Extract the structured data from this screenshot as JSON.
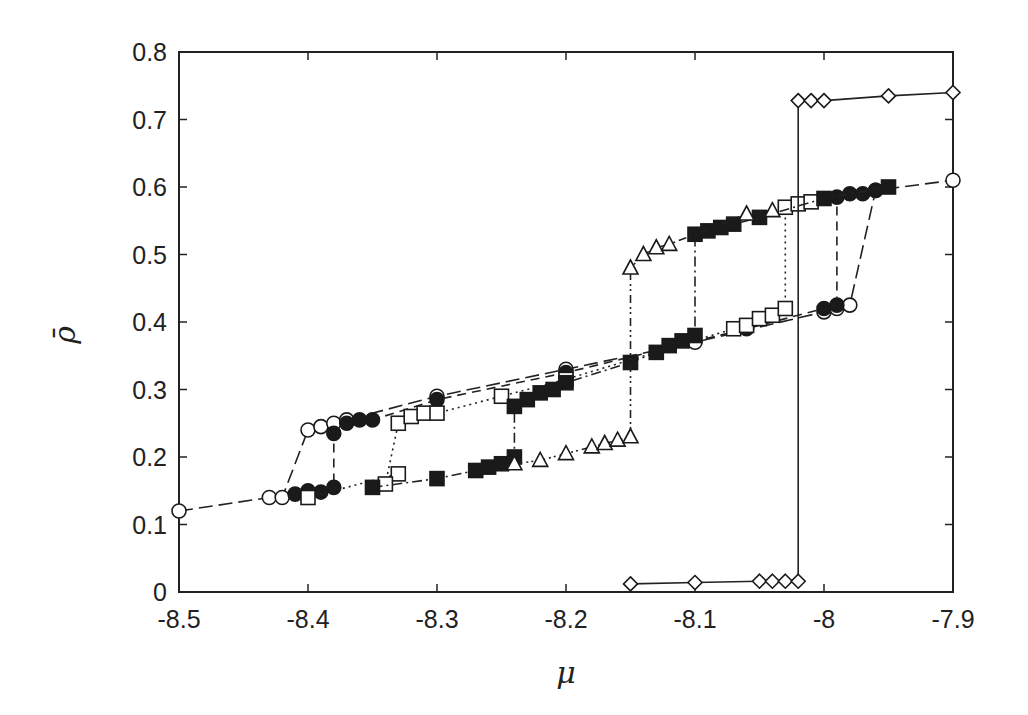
{
  "chart_data": {
    "type": "scatter",
    "title": "",
    "xlabel": "μ",
    "ylabel": "ρ̄",
    "xlim": [
      -8.5,
      -7.9
    ],
    "ylim": [
      0,
      0.8
    ],
    "grid": false,
    "legend": "none",
    "xticks": [
      "-8.5",
      "-8.4",
      "-8.3",
      "-8.2",
      "-8.1",
      "-8",
      "-7.9"
    ],
    "xtick_values": [
      -8.5,
      -8.4,
      -8.3,
      -8.2,
      -8.1,
      -8.0,
      -7.9
    ],
    "yticks": [
      "0",
      "0.1",
      "0.2",
      "0.3",
      "0.4",
      "0.5",
      "0.6",
      "0.7",
      "0.8"
    ],
    "ytick_values": [
      0,
      0.1,
      0.2,
      0.3,
      0.4,
      0.5,
      0.6,
      0.7,
      0.8
    ],
    "series": [
      {
        "name": "open-circles",
        "marker": "circle-open",
        "line": "longdash",
        "points": [
          [
            -8.5,
            0.12
          ],
          [
            -8.43,
            0.14
          ],
          [
            -8.42,
            0.14
          ],
          [
            -8.4,
            0.24
          ],
          [
            -8.39,
            0.245
          ],
          [
            -8.38,
            0.25
          ],
          [
            -8.37,
            0.255
          ],
          [
            -8.3,
            0.29
          ],
          [
            -8.2,
            0.33
          ],
          [
            -8.1,
            0.37
          ],
          [
            -8.0,
            0.415
          ],
          [
            -7.99,
            0.42
          ],
          [
            -7.98,
            0.425
          ],
          [
            -7.96,
            0.595
          ],
          [
            -7.9,
            0.61
          ]
        ],
        "jumps": [
          [
            -8.4,
            0.14,
            0.24
          ],
          [
            -7.98,
            0.425,
            0.59
          ]
        ]
      },
      {
        "name": "filled-circles",
        "marker": "circle-filled",
        "line": "dash",
        "points": [
          [
            -8.41,
            0.145
          ],
          [
            -8.4,
            0.15
          ],
          [
            -8.39,
            0.148
          ],
          [
            -8.38,
            0.155
          ],
          [
            -8.38,
            0.235
          ],
          [
            -8.37,
            0.25
          ],
          [
            -8.36,
            0.255
          ],
          [
            -8.35,
            0.255
          ],
          [
            -8.3,
            0.285
          ],
          [
            -8.2,
            0.325
          ],
          [
            -8.06,
            0.39
          ],
          [
            -8.0,
            0.42
          ],
          [
            -7.99,
            0.425
          ],
          [
            -7.99,
            0.585
          ],
          [
            -7.98,
            0.59
          ],
          [
            -7.97,
            0.59
          ],
          [
            -7.96,
            0.595
          ]
        ],
        "jumps": [
          [
            -8.38,
            0.155,
            0.235
          ],
          [
            -7.99,
            0.425,
            0.585
          ]
        ]
      },
      {
        "name": "open-squares",
        "marker": "square-open",
        "line": "dotted",
        "points": [
          [
            -8.4,
            0.14
          ],
          [
            -8.33,
            0.175
          ],
          [
            -8.34,
            0.16
          ],
          [
            -8.33,
            0.25
          ],
          [
            -8.32,
            0.26
          ],
          [
            -8.31,
            0.265
          ],
          [
            -8.3,
            0.265
          ],
          [
            -8.25,
            0.29
          ],
          [
            -8.2,
            0.315
          ],
          [
            -8.07,
            0.39
          ],
          [
            -8.06,
            0.395
          ],
          [
            -8.05,
            0.405
          ],
          [
            -8.04,
            0.41
          ],
          [
            -8.03,
            0.42
          ],
          [
            -8.03,
            0.57
          ],
          [
            -8.02,
            0.575
          ],
          [
            -8.01,
            0.578
          ]
        ],
        "jumps": [
          [
            -8.33,
            0.175,
            0.25
          ],
          [
            -8.03,
            0.42,
            0.57
          ]
        ]
      },
      {
        "name": "filled-squares",
        "marker": "square-filled",
        "line": "dashdot",
        "points": [
          [
            -8.35,
            0.155
          ],
          [
            -8.3,
            0.168
          ],
          [
            -8.27,
            0.18
          ],
          [
            -8.26,
            0.185
          ],
          [
            -8.25,
            0.19
          ],
          [
            -8.24,
            0.2
          ],
          [
            -8.24,
            0.275
          ],
          [
            -8.23,
            0.285
          ],
          [
            -8.22,
            0.295
          ],
          [
            -8.21,
            0.3
          ],
          [
            -8.2,
            0.31
          ],
          [
            -8.15,
            0.34
          ],
          [
            -8.13,
            0.355
          ],
          [
            -8.12,
            0.365
          ],
          [
            -8.11,
            0.372
          ],
          [
            -8.1,
            0.38
          ],
          [
            -8.1,
            0.53
          ],
          [
            -8.09,
            0.535
          ],
          [
            -8.08,
            0.54
          ],
          [
            -8.07,
            0.545
          ],
          [
            -8.05,
            0.555
          ],
          [
            -8.0,
            0.583
          ],
          [
            -7.95,
            0.6
          ]
        ],
        "jumps": [
          [
            -8.24,
            0.2,
            0.275
          ],
          [
            -8.1,
            0.38,
            0.53
          ]
        ]
      },
      {
        "name": "open-triangles",
        "marker": "triangle-open",
        "line": "dashdotdot",
        "points": [
          [
            -8.24,
            0.19
          ],
          [
            -8.22,
            0.195
          ],
          [
            -8.2,
            0.205
          ],
          [
            -8.18,
            0.215
          ],
          [
            -8.17,
            0.22
          ],
          [
            -8.16,
            0.225
          ],
          [
            -8.15,
            0.23
          ],
          [
            -8.15,
            0.48
          ],
          [
            -8.14,
            0.5
          ],
          [
            -8.13,
            0.51
          ],
          [
            -8.12,
            0.515
          ],
          [
            -8.06,
            0.56
          ],
          [
            -8.04,
            0.565
          ]
        ],
        "jumps": [
          [
            -8.15,
            0.23,
            0.48
          ]
        ]
      },
      {
        "name": "open-diamonds",
        "marker": "diamond-open",
        "line": "solid",
        "points": [
          [
            -8.15,
            0.012
          ],
          [
            -8.1,
            0.014
          ],
          [
            -8.05,
            0.016
          ],
          [
            -8.04,
            0.016
          ],
          [
            -8.03,
            0.016
          ],
          [
            -8.02,
            0.016
          ],
          [
            -8.02,
            0.728
          ],
          [
            -8.01,
            0.728
          ],
          [
            -8.0,
            0.728
          ],
          [
            -7.95,
            0.735
          ],
          [
            -7.9,
            0.74
          ]
        ],
        "jumps": [
          [
            -8.02,
            0.016,
            0.728
          ]
        ]
      }
    ]
  }
}
